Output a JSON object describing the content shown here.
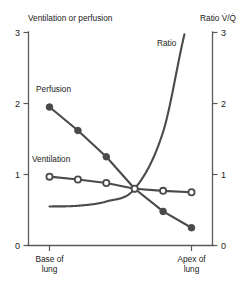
{
  "chart_data": {
    "type": "line",
    "title": "",
    "xlabel": "",
    "ylabel": "Ventilation or perfusion",
    "y2label": "Ratio V̇/Q̇",
    "ylim": [
      0,
      3
    ],
    "y2lim": [
      0,
      3
    ],
    "yticks": [
      "0",
      "1",
      "2",
      "3"
    ],
    "y2ticks": [
      "0",
      "1",
      "2",
      "3"
    ],
    "grid": false,
    "legend_position": "inline-annotations",
    "x_category_labels": [
      {
        "line1": "Base of",
        "line2": "lung"
      },
      {
        "line1": "Apex of",
        "line2": "lung"
      }
    ],
    "x": [
      0,
      1,
      2,
      3,
      4,
      5
    ],
    "series": [
      {
        "name": "Perfusion",
        "axis": "left",
        "marker": "filled",
        "values": [
          1.95,
          1.62,
          1.25,
          0.8,
          0.48,
          0.25
        ]
      },
      {
        "name": "Ventilation",
        "axis": "left",
        "marker": "open",
        "values": [
          0.97,
          0.93,
          0.88,
          0.8,
          0.77,
          0.75
        ]
      },
      {
        "name": "Ratio",
        "axis": "right",
        "marker": "none",
        "values": [
          0.55,
          0.56,
          0.62,
          0.8,
          1.6,
          3.3
        ]
      }
    ],
    "annotations": [
      {
        "text": "Perfusion",
        "for": "perfusion-series"
      },
      {
        "text": "Ventilation",
        "for": "ventilation-series"
      },
      {
        "text": "Ratio",
        "for": "ratio-series"
      }
    ]
  },
  "labels": {
    "left_axis_title": "Ventilation or perfusion",
    "right_axis_title": "Ratio V̇/Q̇",
    "perfusion": "Perfusion",
    "ventilation": "Ventilation",
    "ratio": "Ratio",
    "base_line1": "Base of",
    "base_line2": "lung",
    "apex_line1": "Apex of",
    "apex_line2": "lung",
    "y_tick_0": "0",
    "y_tick_1": "1",
    "y_tick_2": "2",
    "y_tick_3": "3",
    "y2_tick_0": "0",
    "y2_tick_1": "1",
    "y2_tick_2": "2",
    "y2_tick_3": "3"
  },
  "colors": {
    "line": "#4a4a4a",
    "axis": "#5a5a5a",
    "text": "#222222",
    "background": "#ffffff"
  }
}
